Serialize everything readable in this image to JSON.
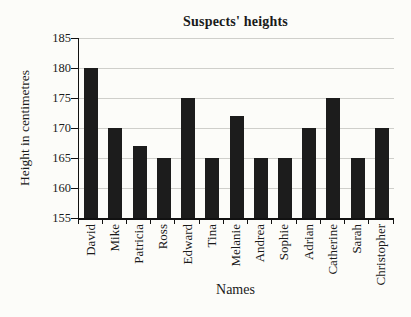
{
  "figure": {
    "title": "Suspects' heights",
    "xlabel": "Names",
    "ylabel": "Height in centimetres"
  },
  "chart_data": {
    "type": "bar",
    "title": "Suspects' heights",
    "xlabel": "Names",
    "ylabel": "Height in centimetres",
    "categories": [
      "David",
      "Mike",
      "Patricia",
      "Ross",
      "Edward",
      "Tina",
      "Melanie",
      "Andrea",
      "Sophie",
      "Adrian",
      "Catherine",
      "Sarah",
      "Christopher"
    ],
    "values": [
      180,
      170,
      167,
      165,
      175,
      165,
      172,
      165,
      165,
      170,
      175,
      165,
      170
    ],
    "ylim": [
      155,
      185
    ],
    "yticks": [
      155,
      160,
      165,
      170,
      175,
      180,
      185
    ],
    "grid": true,
    "legend": "none",
    "bar_color": "#1c1c1c",
    "gridline_color": "#cfcfcb",
    "background_color": "#fcfcf9"
  }
}
